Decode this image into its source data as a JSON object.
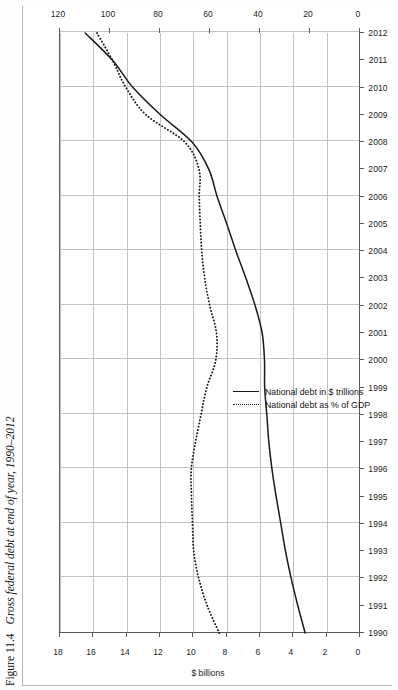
{
  "figure": {
    "number": "Figure 11.4",
    "caption": "Gross federal debt at end of year, 1990–2012"
  },
  "chart_data": {
    "type": "line",
    "title": "Gross federal debt at end of year, 1990–2012",
    "xlabel": "",
    "ylabel": "$ billions",
    "y2label": "",
    "grid": true,
    "legend_position": "inside-right",
    "orientation": "rotated-90-ccw",
    "xlim": [
      1990,
      2012
    ],
    "ylim": [
      0,
      18
    ],
    "y2lim": [
      0,
      120
    ],
    "yticks": [
      0,
      2,
      4,
      6,
      8,
      10,
      12,
      14,
      16,
      18
    ],
    "ytick_labels": [
      "0",
      "2",
      "4",
      "6",
      "8",
      "10",
      "12",
      "14",
      "16",
      "18"
    ],
    "y2ticks": [
      0,
      20,
      40,
      60,
      80,
      100,
      120
    ],
    "y2tick_labels": [
      "0",
      "20",
      "40",
      "60",
      "80",
      "100",
      "120"
    ],
    "x": [
      1990,
      1991,
      1992,
      1993,
      1994,
      1995,
      1996,
      1997,
      1998,
      1999,
      2000,
      2001,
      2002,
      2003,
      2004,
      2005,
      2006,
      2007,
      2008,
      2009,
      2010,
      2011,
      2012
    ],
    "xtick_labels": [
      "1990",
      "1991",
      "1992",
      "1993",
      "1994",
      "1995",
      "1996",
      "1997",
      "1998",
      "1999",
      "2000",
      "2001",
      "2002",
      "2003",
      "2004",
      "2005",
      "2006",
      "2007",
      "2008",
      "2009",
      "2010",
      "2011",
      "2012"
    ],
    "series": [
      {
        "name": "National debt in $ trillions",
        "style": "solid",
        "axis": "left",
        "color": "#1a1a1a",
        "values": [
          3.23,
          3.67,
          4.07,
          4.41,
          4.69,
          4.97,
          5.22,
          5.41,
          5.53,
          5.66,
          5.67,
          5.81,
          6.23,
          6.78,
          7.38,
          7.93,
          8.51,
          9.01,
          10.02,
          11.91,
          13.56,
          14.79,
          16.43
        ]
      },
      {
        "name": "National debt as % of GDP",
        "style": "dotted",
        "axis": "top",
        "color": "#1a1a1a",
        "values": [
          55.9,
          60.7,
          64.1,
          66.1,
          66.6,
          67.0,
          67.1,
          65.4,
          63.2,
          60.9,
          57.3,
          57.0,
          59.7,
          61.7,
          62.9,
          63.5,
          63.9,
          64.0,
          69.7,
          85.2,
          93.2,
          98.6,
          104.8
        ]
      }
    ]
  },
  "axes": {
    "left_title": "$ billions",
    "top_title": ""
  },
  "legend": {
    "items": [
      {
        "label": "National debt in $ trillions",
        "style": "solid"
      },
      {
        "label": "National debt as % of GDP",
        "style": "dotted"
      }
    ]
  }
}
